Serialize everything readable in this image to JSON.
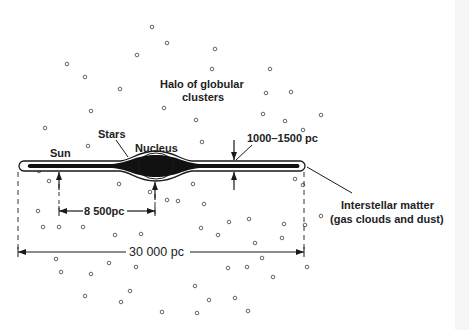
{
  "diagram": {
    "labels": {
      "halo_line1": "Halo of globular",
      "halo_line2": "clusters",
      "stars": "Stars",
      "nucleus": "Nucleus",
      "sun": "Sun",
      "thickness": "1000–1500 pc",
      "interstellar_line1": "Interstellar matter",
      "interstellar_line2": "(gas clouds and dust)",
      "sun_distance": "8 500pc",
      "diameter": "30 000 pc"
    },
    "colors": {
      "ink": "#1a1a1a",
      "background": "#ffffff",
      "cluster": "#555555",
      "edge_strip": "#f6f6f6"
    },
    "globular_clusters": [
      [
        152,
        27
      ],
      [
        167,
        43
      ],
      [
        67,
        64
      ],
      [
        137,
        55
      ],
      [
        215,
        49
      ],
      [
        212,
        69
      ],
      [
        85,
        77
      ],
      [
        120,
        89
      ],
      [
        270,
        69
      ],
      [
        266,
        93
      ],
      [
        291,
        92
      ],
      [
        91,
        111
      ],
      [
        164,
        108
      ],
      [
        196,
        120
      ],
      [
        263,
        114
      ],
      [
        321,
        115
      ],
      [
        45,
        128
      ],
      [
        88,
        146
      ],
      [
        202,
        142
      ],
      [
        285,
        121
      ],
      [
        303,
        130
      ],
      [
        39,
        171
      ],
      [
        49,
        181
      ],
      [
        38,
        211
      ],
      [
        43,
        227
      ],
      [
        59,
        227
      ],
      [
        83,
        227
      ],
      [
        119,
        184
      ],
      [
        150,
        192
      ],
      [
        115,
        235
      ],
      [
        141,
        234
      ],
      [
        178,
        201
      ],
      [
        193,
        184
      ],
      [
        204,
        204
      ],
      [
        201,
        228
      ],
      [
        229,
        222
      ],
      [
        218,
        235
      ],
      [
        249,
        219
      ],
      [
        228,
        268
      ],
      [
        255,
        243
      ],
      [
        284,
        224
      ],
      [
        262,
        258
      ],
      [
        282,
        238
      ],
      [
        295,
        179
      ],
      [
        303,
        185
      ],
      [
        321,
        216
      ],
      [
        305,
        225
      ],
      [
        56,
        259
      ],
      [
        61,
        272
      ],
      [
        91,
        274
      ],
      [
        109,
        263
      ],
      [
        136,
        267
      ],
      [
        130,
        291
      ],
      [
        121,
        302
      ],
      [
        162,
        312
      ],
      [
        195,
        286
      ],
      [
        209,
        300
      ],
      [
        235,
        298
      ],
      [
        247,
        267
      ],
      [
        273,
        277
      ],
      [
        248,
        311
      ],
      [
        167,
        200
      ],
      [
        85,
        296
      ],
      [
        197,
        313
      ],
      [
        307,
        267
      ]
    ]
  }
}
